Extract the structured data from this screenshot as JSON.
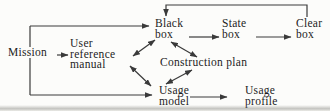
{
  "diagram": {
    "colors": {
      "background": "#fcfcfa",
      "line": "#3a3a3a",
      "text": "#1d1d1d"
    },
    "nodes": [
      {
        "id": "mission",
        "label": "Mission",
        "x": 7,
        "y": 47,
        "masked": true
      },
      {
        "id": "user-reference-manual",
        "label": "User\nreference\nmanual",
        "x": 70,
        "y": 38
      },
      {
        "id": "black-box",
        "label": "Black\nbox",
        "x": 155,
        "y": 18
      },
      {
        "id": "state-box",
        "label": "State\nbox",
        "x": 222,
        "y": 18
      },
      {
        "id": "clear-box",
        "label": "Clear\nbox",
        "x": 296,
        "y": 18
      },
      {
        "id": "construction-plan",
        "label": "Construction plan",
        "x": 160,
        "y": 57
      },
      {
        "id": "usage-model",
        "label": "Usage\nmodel",
        "x": 159,
        "y": 85
      },
      {
        "id": "usage-profile",
        "label": "Usage\nprofile",
        "x": 245,
        "y": 85
      }
    ],
    "edges": [
      {
        "name": "mission-to-user-reference-manual",
        "points": [
          [
            57,
            55
          ],
          [
            68,
            55
          ]
        ],
        "arrows": "end"
      },
      {
        "name": "mission-branch-line",
        "points": [
          [
            30,
            26
          ],
          [
            30,
            95
          ]
        ],
        "arrows": "none"
      },
      {
        "name": "mission-to-black-box",
        "points": [
          [
            30,
            26
          ],
          [
            149,
            26
          ]
        ],
        "arrows": "end"
      },
      {
        "name": "mission-to-usage-model",
        "points": [
          [
            30,
            95
          ],
          [
            152,
            95
          ]
        ],
        "arrows": "end"
      },
      {
        "name": "black-box-to-state-box",
        "points": [
          [
            189,
            37
          ],
          [
            219,
            37
          ]
        ],
        "arrows": "end"
      },
      {
        "name": "state-box-to-clear-box",
        "points": [
          [
            256,
            37
          ],
          [
            291,
            37
          ]
        ],
        "arrows": "end"
      },
      {
        "name": "clear-box-to-black-box",
        "points": [
          [
            307,
            17
          ],
          [
            307,
            5
          ],
          [
            166,
            5
          ],
          [
            166,
            16
          ]
        ],
        "arrows": "end"
      },
      {
        "name": "user-reference-manual-black-box",
        "points": [
          [
            133,
            56
          ],
          [
            155,
            40
          ]
        ],
        "arrows": "both"
      },
      {
        "name": "user-reference-manual-usage-model",
        "points": [
          [
            130,
            66
          ],
          [
            151,
            86
          ]
        ],
        "arrows": "both"
      },
      {
        "name": "black-box-construction-plan",
        "points": [
          [
            171,
            42
          ],
          [
            197,
            57
          ]
        ],
        "arrows": "both"
      },
      {
        "name": "construction-plan-usage-model",
        "points": [
          [
            192,
            70
          ],
          [
            166,
            84
          ]
        ],
        "arrows": "both"
      },
      {
        "name": "usage-model-to-usage-profile",
        "points": [
          [
            190,
            97
          ],
          [
            227,
            97
          ]
        ],
        "arrows": "end"
      }
    ]
  }
}
